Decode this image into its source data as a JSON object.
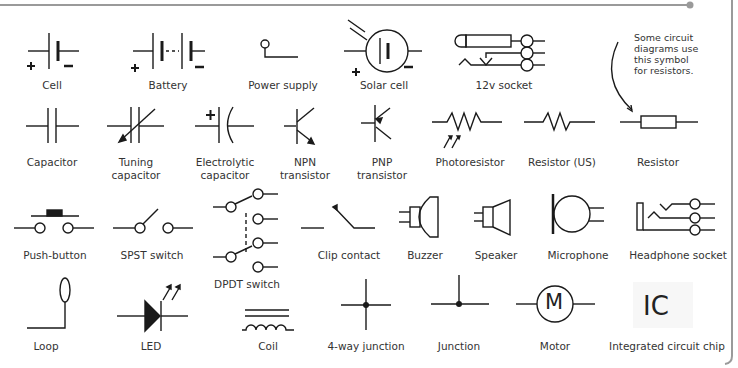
{
  "colors": {
    "frame": "#9a9a9a",
    "stroke": "#1a1a1a",
    "text": "#333333"
  },
  "note": [
    "Some circuit",
    "diagrams use",
    "this symbol",
    "for resistors."
  ],
  "symbols": [
    {
      "name": "Cell",
      "label": [
        "Cell"
      ]
    },
    {
      "name": "Battery",
      "label": [
        "Battery"
      ]
    },
    {
      "name": "Power supply",
      "label": [
        "Power supply"
      ]
    },
    {
      "name": "Solar cell",
      "label": [
        "Solar cell"
      ]
    },
    {
      "name": "12v socket",
      "label": [
        "12v socket"
      ]
    },
    {
      "name": "Capacitor",
      "label": [
        "Capacitor"
      ]
    },
    {
      "name": "Tuning capacitor",
      "label": [
        "Tuning",
        "capacitor"
      ]
    },
    {
      "name": "Electrolytic capacitor",
      "label": [
        "Electrolytic",
        "capacitor"
      ]
    },
    {
      "name": "NPN transistor",
      "label": [
        "NPN",
        "transistor"
      ]
    },
    {
      "name": "PNP transistor",
      "label": [
        "PNP",
        "transistor"
      ]
    },
    {
      "name": "Photoresistor",
      "label": [
        "Photoresistor"
      ]
    },
    {
      "name": "Resistor (US)",
      "label": [
        "Resistor (US)"
      ]
    },
    {
      "name": "Resistor",
      "label": [
        "Resistor"
      ]
    },
    {
      "name": "Push-button",
      "label": [
        "Push-button"
      ]
    },
    {
      "name": "SPST switch",
      "label": [
        "SPST switch"
      ]
    },
    {
      "name": "DPDT switch",
      "label": [
        "DPDT switch"
      ]
    },
    {
      "name": "Clip contact",
      "label": [
        "Clip contact"
      ]
    },
    {
      "name": "Buzzer",
      "label": [
        "Buzzer"
      ]
    },
    {
      "name": "Speaker",
      "label": [
        "Speaker"
      ]
    },
    {
      "name": "Microphone",
      "label": [
        "Microphone"
      ]
    },
    {
      "name": "Headphone socket",
      "label": [
        "Headphone socket"
      ]
    },
    {
      "name": "Loop",
      "label": [
        "Loop"
      ]
    },
    {
      "name": "LED",
      "label": [
        "LED"
      ]
    },
    {
      "name": "Coil",
      "label": [
        "Coil"
      ]
    },
    {
      "name": "4-way junction",
      "label": [
        "4-way junction"
      ]
    },
    {
      "name": "Junction",
      "label": [
        "Junction"
      ]
    },
    {
      "name": "Motor",
      "label": [
        "Motor"
      ]
    },
    {
      "name": "Integrated circuit chip",
      "label": [
        "Integrated circuit chip"
      ]
    }
  ],
  "glyphs": {
    "plus": "+",
    "minus": "−",
    "motor": "M",
    "ic": "IC"
  }
}
